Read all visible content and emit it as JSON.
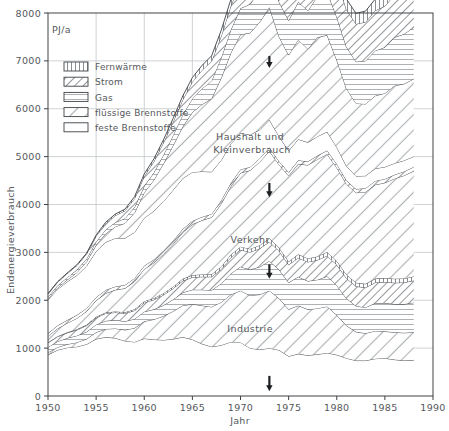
{
  "chart_data": {
    "type": "area",
    "title": "",
    "xlabel": "Jahr",
    "ylabel": "Endenergieverbrauch",
    "unit": "PJ/a",
    "xlim": [
      1950,
      1990
    ],
    "ylim": [
      0,
      8000
    ],
    "grid": true,
    "legend_position": "top-left-inside",
    "xticks": [
      1950,
      1955,
      1960,
      1965,
      1970,
      1975,
      1980,
      1985,
      1990
    ],
    "yticks": [
      0,
      1000,
      2000,
      3000,
      4000,
      5000,
      6000,
      7000,
      8000
    ],
    "legend": [
      {
        "name": "Fernwärme",
        "pattern": "vertical-hatch"
      },
      {
        "name": "Strom",
        "pattern": "diagonal-hatch-narrow"
      },
      {
        "name": "Gas",
        "pattern": "horizontal-lines"
      },
      {
        "name": "flüssige Brennstoffe",
        "pattern": "diagonal-hatch-wide"
      },
      {
        "name": "feste Brennstoffe",
        "pattern": "blank"
      }
    ],
    "sector_labels": [
      {
        "text": "Haushalt und",
        "x": 1971.0,
        "y": 5350
      },
      {
        "text": "Kleinverbrauch",
        "x": 1971.2,
        "y": 5080
      },
      {
        "text": "Verkehr",
        "x": 1971.0,
        "y": 3200
      },
      {
        "text": "Industrie",
        "x": 1971.0,
        "y": 1330
      }
    ],
    "annotations": [
      {
        "type": "arrow-down",
        "x": 1973,
        "y_top": 4450,
        "y_bottom": 4150,
        "note": "oil crisis marker upper"
      },
      {
        "type": "arrow-down",
        "x": 1973,
        "y_top": 2750,
        "y_bottom": 2450,
        "note": "oil crisis marker middle"
      },
      {
        "type": "arrow-down",
        "x": 1973,
        "y_top": 7100,
        "y_bottom": 6850,
        "note": "oil crisis marker top"
      },
      {
        "type": "arrow-down",
        "x": 1973,
        "y_top": 420,
        "y_bottom": 100,
        "note": "oil crisis marker axis"
      }
    ],
    "x": [
      1950,
      1951,
      1952,
      1953,
      1954,
      1955,
      1956,
      1957,
      1958,
      1959,
      1960,
      1961,
      1962,
      1963,
      1964,
      1965,
      1966,
      1967,
      1968,
      1969,
      1970,
      1971,
      1972,
      1973,
      1974,
      1975,
      1976,
      1977,
      1978,
      1979,
      1980,
      1981,
      1982,
      1983,
      1984,
      1985,
      1986,
      1987,
      1988
    ],
    "series": [
      {
        "name": "Industrie feste Brennstoffe",
        "sector": "Industrie",
        "energy": "feste Brennstoffe",
        "pattern": "blank",
        "values": [
          860,
          960,
          1010,
          1030,
          1080,
          1190,
          1230,
          1210,
          1150,
          1130,
          1200,
          1180,
          1170,
          1190,
          1230,
          1180,
          1090,
          1030,
          1060,
          1130,
          1120,
          1000,
          970,
          1000,
          960,
          830,
          880,
          850,
          870,
          900,
          860,
          790,
          740,
          740,
          780,
          790,
          760,
          740,
          750
        ]
      },
      {
        "name": "Industrie flüssige Brennstoffe",
        "sector": "Industrie",
        "energy": "flüssige Brennstoffe",
        "pattern": "diagonal-hatch-wide",
        "values": [
          50,
          60,
          70,
          90,
          110,
          140,
          170,
          200,
          230,
          290,
          360,
          420,
          500,
          580,
          660,
          740,
          800,
          830,
          900,
          990,
          1080,
          1100,
          1150,
          1200,
          1080,
          980,
          1010,
          960,
          960,
          970,
          830,
          680,
          600,
          570,
          580,
          560,
          570,
          580,
          580
        ]
      },
      {
        "name": "Industrie Gas",
        "sector": "Industrie",
        "energy": "Gas",
        "pattern": "horizontal-lines",
        "values": [
          110,
          120,
          130,
          140,
          150,
          160,
          170,
          175,
          180,
          190,
          200,
          210,
          225,
          245,
          270,
          300,
          330,
          350,
          390,
          440,
          500,
          540,
          580,
          620,
          600,
          560,
          600,
          590,
          600,
          630,
          620,
          570,
          540,
          540,
          580,
          590,
          590,
          600,
          620
        ]
      },
      {
        "name": "Industrie Strom",
        "sector": "Industrie",
        "energy": "Strom",
        "pattern": "diagonal-hatch-narrow",
        "values": [
          90,
          100,
          110,
          120,
          130,
          145,
          155,
          160,
          165,
          175,
          190,
          200,
          215,
          230,
          245,
          260,
          270,
          280,
          300,
          330,
          355,
          365,
          380,
          400,
          390,
          370,
          395,
          400,
          410,
          430,
          430,
          420,
          410,
          415,
          430,
          440,
          445,
          450,
          460
        ]
      },
      {
        "name": "Industrie Fernwärme",
        "sector": "Industrie",
        "energy": "Fernwärme",
        "pattern": "vertical-hatch",
        "values": [
          10,
          10,
          12,
          14,
          16,
          18,
          20,
          22,
          24,
          26,
          30,
          32,
          35,
          38,
          42,
          46,
          50,
          52,
          56,
          60,
          65,
          68,
          70,
          75,
          72,
          70,
          74,
          74,
          76,
          80,
          80,
          78,
          76,
          78,
          82,
          84,
          85,
          86,
          88
        ]
      },
      {
        "name": "Verkehr flüssige Brennstoffe",
        "sector": "Verkehr",
        "energy": "flüssige Brennstoffe",
        "pattern": "diagonal-hatch-wide",
        "values": [
          130,
          160,
          190,
          230,
          280,
          340,
          400,
          450,
          500,
          580,
          670,
          740,
          820,
          890,
          970,
          1060,
          1130,
          1190,
          1310,
          1430,
          1540,
          1640,
          1740,
          1820,
          1730,
          1790,
          1890,
          1950,
          2030,
          2040,
          1950,
          1890,
          1880,
          1920,
          1960,
          1990,
          2090,
          2150,
          2200
        ]
      },
      {
        "name": "Verkehr Strom",
        "sector": "Verkehr",
        "energy": "Strom",
        "pattern": "diagonal-hatch-narrow",
        "values": [
          60,
          62,
          64,
          66,
          68,
          70,
          70,
          70,
          70,
          70,
          70,
          70,
          70,
          70,
          70,
          70,
          70,
          70,
          70,
          70,
          72,
          72,
          72,
          74,
          72,
          72,
          74,
          74,
          76,
          78,
          78,
          76,
          76,
          78,
          80,
          80,
          82,
          84,
          86
        ]
      },
      {
        "name": "Haushalt und Kleinverbrauch feste Brennstoffe",
        "sector": "Haushalt und Kleinverbrauch",
        "energy": "feste Brennstoffe",
        "pattern": "blank",
        "values": [
          700,
          760,
          800,
          830,
          880,
          960,
          1000,
          1010,
          980,
          960,
          1000,
          1010,
          1030,
          1060,
          1060,
          1020,
          950,
          880,
          840,
          820,
          760,
          670,
          600,
          580,
          520,
          450,
          440,
          400,
          400,
          390,
          350,
          300,
          270,
          260,
          260,
          250,
          240,
          230,
          220
        ]
      },
      {
        "name": "Haushalt und Kleinverbrauch flüssige Brennstoffe",
        "sector": "Haushalt und Kleinverbrauch",
        "energy": "flüssige Brennstoffe",
        "pattern": "diagonal-hatch-wide",
        "values": [
          20,
          30,
          40,
          60,
          90,
          130,
          180,
          240,
          310,
          410,
          530,
          650,
          790,
          930,
          1080,
          1250,
          1400,
          1530,
          1720,
          1900,
          2060,
          2130,
          2250,
          2350,
          2080,
          2000,
          2080,
          1950,
          2070,
          2020,
          1820,
          1620,
          1520,
          1500,
          1520,
          1540,
          1620,
          1600,
          1620
        ]
      },
      {
        "name": "Haushalt und Kleinverbrauch Gas",
        "sector": "Haushalt und Kleinverbrauch",
        "energy": "Gas",
        "pattern": "horizontal-lines",
        "values": [
          40,
          45,
          50,
          55,
          60,
          70,
          80,
          90,
          100,
          115,
          135,
          155,
          180,
          210,
          245,
          285,
          330,
          370,
          420,
          480,
          545,
          600,
          660,
          720,
          730,
          720,
          790,
          800,
          860,
          900,
          900,
          870,
          870,
          900,
          940,
          960,
          1010,
          1040,
          1080
        ]
      },
      {
        "name": "Haushalt und Kleinverbrauch Strom",
        "sector": "Haushalt und Kleinverbrauch",
        "energy": "Strom",
        "pattern": "diagonal-hatch-narrow",
        "values": [
          60,
          70,
          80,
          90,
          100,
          115,
          130,
          145,
          160,
          180,
          205,
          230,
          255,
          285,
          315,
          350,
          385,
          415,
          455,
          500,
          545,
          580,
          620,
          660,
          660,
          660,
          700,
          720,
          760,
          790,
          790,
          780,
          790,
          810,
          840,
          860,
          890,
          910,
          940
        ]
      },
      {
        "name": "Haushalt und Kleinverbrauch Fernwärme",
        "sector": "Haushalt und Kleinverbrauch",
        "energy": "Fernwärme",
        "pattern": "vertical-hatch",
        "values": [
          10,
          12,
          14,
          16,
          18,
          22,
          26,
          30,
          34,
          40,
          48,
          55,
          62,
          70,
          80,
          90,
          100,
          110,
          120,
          135,
          150,
          160,
          170,
          185,
          185,
          185,
          200,
          205,
          215,
          225,
          225,
          220,
          220,
          230,
          240,
          245,
          255,
          262,
          270
        ]
      }
    ]
  }
}
